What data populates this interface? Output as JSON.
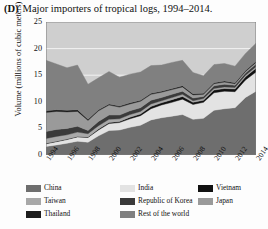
{
  "figure": {
    "panel_letter": "(D)",
    "title": "Major importers of tropical logs, 1994–2014."
  },
  "axes": {
    "ylabel": "Volume (millions of cubic meters)",
    "yticks": [
      "0",
      "5",
      "10",
      "15",
      "20",
      "25"
    ],
    "xticks": [
      "1994",
      "1996",
      "1998",
      "2000",
      "2002",
      "2004",
      "2006",
      "2008",
      "2010",
      "2012",
      "2014"
    ]
  },
  "legend": {
    "items": [
      {
        "label": "China",
        "color": "#6e6e6e"
      },
      {
        "label": "India",
        "color": "#e3e3e3"
      },
      {
        "label": "Vietnam",
        "color": "#111111"
      },
      {
        "label": "Taiwan",
        "color": "#a8a8a8"
      },
      {
        "label": "Republic of Korea",
        "color": "#3a3a3a"
      },
      {
        "label": "Japan",
        "color": "#9a9a9a"
      },
      {
        "label": "Thailand",
        "color": "#1d1d1d"
      },
      {
        "label": "Rest of the world",
        "color": "#808080"
      }
    ]
  },
  "chart_data": {
    "type": "area",
    "title": "Major importers of tropical logs, 1994–2014.",
    "xlabel": "",
    "ylabel": "Volume (millions of cubic meters)",
    "ylim": [
      0,
      25
    ],
    "grid": true,
    "stacked": true,
    "legend_position": "bottom",
    "x": [
      1994,
      1995,
      1996,
      1997,
      1998,
      1999,
      2000,
      2001,
      2002,
      2003,
      2004,
      2005,
      2006,
      2007,
      2008,
      2009,
      2010,
      2011,
      2012,
      2013,
      2014
    ],
    "series": [
      {
        "name": "China",
        "color": "#6e6e6e",
        "values": [
          1.6,
          1.9,
          2.2,
          2.6,
          2.4,
          3.6,
          4.6,
          4.7,
          5.2,
          5.6,
          6.6,
          7.0,
          7.3,
          7.6,
          6.7,
          6.9,
          8.4,
          8.7,
          8.9,
          10.8,
          12.0
        ]
      },
      {
        "name": "India",
        "color": "#e3e3e3",
        "values": [
          0.5,
          0.6,
          0.7,
          0.8,
          0.9,
          1.1,
          1.3,
          1.4,
          1.6,
          1.8,
          2.1,
          2.4,
          2.6,
          2.9,
          2.8,
          3.0,
          3.3,
          3.3,
          3.0,
          3.3,
          3.6
        ]
      },
      {
        "name": "Vietnam",
        "color": "#111111",
        "values": [
          0.1,
          0.1,
          0.1,
          0.1,
          0.1,
          0.2,
          0.2,
          0.2,
          0.3,
          0.3,
          0.4,
          0.4,
          0.5,
          0.5,
          0.4,
          0.4,
          0.5,
          0.5,
          0.5,
          0.6,
          0.7
        ]
      },
      {
        "name": "Taiwan",
        "color": "#a8a8a8",
        "values": [
          0.9,
          0.9,
          0.8,
          0.8,
          0.6,
          0.6,
          0.6,
          0.5,
          0.5,
          0.5,
          0.5,
          0.4,
          0.4,
          0.4,
          0.3,
          0.3,
          0.3,
          0.3,
          0.3,
          0.3,
          0.3
        ]
      },
      {
        "name": "Republic of Korea",
        "color": "#3a3a3a",
        "values": [
          1.3,
          1.3,
          1.2,
          1.1,
          0.6,
          0.8,
          0.8,
          0.7,
          0.7,
          0.7,
          0.7,
          0.6,
          0.6,
          0.6,
          0.5,
          0.4,
          0.5,
          0.5,
          0.4,
          0.4,
          0.5
        ]
      },
      {
        "name": "Japan",
        "color": "#9a9a9a",
        "values": [
          3.6,
          3.4,
          3.1,
          2.8,
          1.9,
          2.0,
          1.9,
          1.5,
          1.3,
          1.2,
          1.1,
          1.0,
          0.9,
          0.8,
          0.6,
          0.4,
          0.4,
          0.4,
          0.3,
          0.3,
          0.3
        ]
      },
      {
        "name": "Thailand",
        "color": "#1d1d1d",
        "values": [
          0.3,
          0.3,
          0.3,
          0.3,
          0.2,
          0.2,
          0.2,
          0.2,
          0.2,
          0.2,
          0.2,
          0.2,
          0.2,
          0.2,
          0.2,
          0.2,
          0.2,
          0.2,
          0.2,
          0.2,
          0.2
        ]
      },
      {
        "name": "Rest of the world",
        "color": "#808080",
        "values": [
          9.5,
          8.6,
          8.0,
          8.4,
          6.6,
          6.0,
          6.1,
          5.4,
          5.4,
          5.3,
          5.2,
          4.9,
          4.9,
          4.8,
          4.0,
          3.3,
          3.4,
          3.3,
          3.1,
          3.2,
          3.4
        ]
      }
    ],
    "totals": [
      17.8,
      17.1,
      16.4,
      16.9,
      13.3,
      14.5,
      15.7,
      14.6,
      15.2,
      15.6,
      16.8,
      16.9,
      17.4,
      17.8,
      15.5,
      14.9,
      17.0,
      17.2,
      16.7,
      19.1,
      21.0
    ]
  }
}
